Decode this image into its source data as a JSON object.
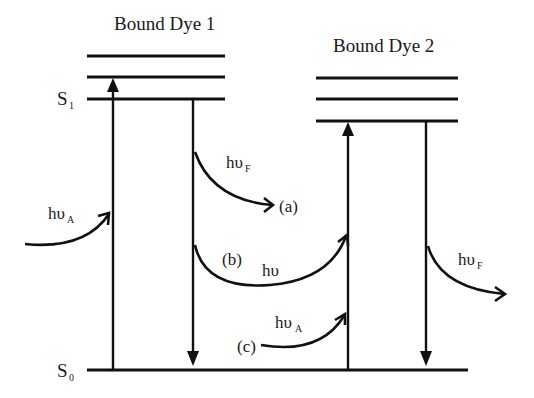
{
  "diagram": {
    "type": "jablonski-energy-transfer",
    "dye1": {
      "title": "Bound Dye 1"
    },
    "dye2": {
      "title": "Bound Dye 2"
    },
    "states": {
      "s1": {
        "letter": "S",
        "sub": "1"
      },
      "s0": {
        "letter": "S",
        "sub": "0"
      }
    },
    "labels": {
      "absorb_dye1": {
        "main": "hυ",
        "sub": "A"
      },
      "fluor_dye1": {
        "main": "hυ",
        "sub": "F"
      },
      "path_a": "(a)",
      "path_b": "(b)",
      "transfer": {
        "main": "hυ"
      },
      "path_c": "(c)",
      "absorb_dye2": {
        "main": "hυ",
        "sub": "A"
      },
      "fluor_dye2": {
        "main": "hυ",
        "sub": "F"
      }
    }
  }
}
